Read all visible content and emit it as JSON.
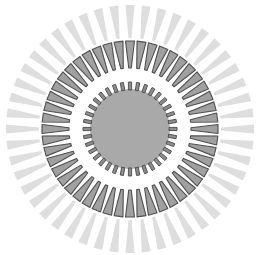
{
  "diagram": {
    "type": "radial-ring-figure",
    "center": {
      "x": 130,
      "y": 129
    },
    "colors": {
      "background": "#ffffff",
      "disc_fill": "#a9a9a9",
      "tooth_fill": "#8c8c8c",
      "tooth_stroke": "#4a4a4a",
      "trapezoid_fill": "#a0a0a0",
      "trapezoid_stroke": "#4f4f4f",
      "ray_fill": "#dedede"
    },
    "core_disc": {
      "radius": 40
    },
    "inner_teeth": {
      "count": 36,
      "r_inner": 39,
      "r_outer": 47,
      "width": 3.2
    },
    "trapezoid_ring": {
      "count": 48,
      "r_inner": 61,
      "r_outer": 88,
      "inner_width": 2.5,
      "outer_width": 9
    },
    "rays": {
      "count": 48,
      "r_inner": 91,
      "r_outer": 124,
      "inner_width": 3,
      "outer_width": 9
    }
  }
}
